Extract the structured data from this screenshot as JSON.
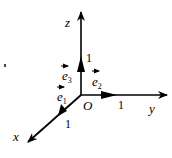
{
  "diagram": {
    "origin_label": "O",
    "axes": {
      "x": {
        "label": "x",
        "unit_label": "1",
        "basis": "e",
        "basis_sub": "1"
      },
      "y": {
        "label": "y",
        "unit_label": "1",
        "basis": "e",
        "basis_sub": "2"
      },
      "z": {
        "label": "z",
        "unit_label": "1",
        "basis": "e",
        "basis_sub": "3"
      }
    },
    "colors": {
      "stroke": "#000000",
      "background": "#ffffff"
    }
  }
}
